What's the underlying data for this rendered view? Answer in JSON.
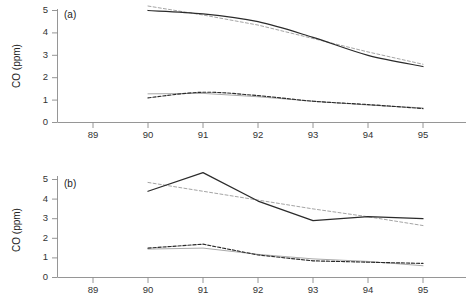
{
  "figure": {
    "background": "#ffffff",
    "width": 474,
    "height": 305,
    "panel_count": 2
  },
  "colors": {
    "observed": "#2b2b2b",
    "trend": "#9a9a9a",
    "axis": "#8a8a8a",
    "text": "#222222"
  },
  "axes": {
    "y_title": "CO (ppm)",
    "y_ticks": [
      "0",
      "1",
      "2",
      "3",
      "4",
      "5"
    ],
    "x_ticks": [
      "89",
      "90",
      "91",
      "92",
      "93",
      "94",
      "95"
    ]
  },
  "panels": {
    "a": {
      "label": "(a)"
    },
    "b": {
      "label": "(b)"
    }
  },
  "chart_data": [
    {
      "type": "line",
      "panel": "(a)",
      "title": "",
      "xlabel": "",
      "ylabel": "CO (ppm)",
      "xlim": [
        88.5,
        95.6
      ],
      "ylim": [
        0,
        5.3
      ],
      "xticks": [
        89,
        90,
        91,
        92,
        93,
        94,
        95
      ],
      "yticks": [
        0,
        1,
        2,
        3,
        4,
        5
      ],
      "grid": false,
      "legend": "none",
      "x": [
        90,
        91,
        92,
        93,
        94,
        95
      ],
      "series": [
        {
          "name": "upper-observed",
          "style": "solid",
          "color": "#2b2b2b",
          "values": [
            5.0,
            4.85,
            4.5,
            3.8,
            3.0,
            2.5
          ]
        },
        {
          "name": "upper-trend",
          "style": "dashed",
          "color": "#9a9a9a",
          "values": [
            5.2,
            4.8,
            4.35,
            3.75,
            3.15,
            2.6
          ]
        },
        {
          "name": "lower-observed",
          "style": "dashed",
          "color": "#2b2b2b",
          "values": [
            1.1,
            1.35,
            1.2,
            0.95,
            0.8,
            0.62
          ]
        },
        {
          "name": "lower-trend",
          "style": "solid",
          "color": "#9a9a9a",
          "values": [
            1.28,
            1.3,
            1.15,
            0.95,
            0.78,
            0.65
          ]
        }
      ]
    },
    {
      "type": "line",
      "panel": "(b)",
      "title": "",
      "xlabel": "",
      "ylabel": "CO (ppm)",
      "xlim": [
        88.5,
        95.6
      ],
      "ylim": [
        0,
        5.5
      ],
      "xticks": [
        89,
        90,
        91,
        92,
        93,
        94,
        95
      ],
      "yticks": [
        0,
        1,
        2,
        3,
        4,
        5
      ],
      "grid": false,
      "legend": "none",
      "x": [
        90,
        91,
        92,
        93,
        94,
        95
      ],
      "series": [
        {
          "name": "upper-observed",
          "style": "solid",
          "color": "#2b2b2b",
          "values": [
            4.4,
            5.35,
            3.9,
            2.9,
            3.1,
            3.0
          ]
        },
        {
          "name": "upper-trend",
          "style": "dashed",
          "color": "#9a9a9a",
          "values": [
            4.85,
            4.4,
            3.95,
            3.5,
            3.1,
            2.65
          ]
        },
        {
          "name": "lower-observed",
          "style": "dashed",
          "color": "#2b2b2b",
          "values": [
            1.5,
            1.7,
            1.15,
            0.85,
            0.78,
            0.72
          ]
        },
        {
          "name": "lower-trend",
          "style": "solid",
          "color": "#9a9a9a",
          "values": [
            1.45,
            1.5,
            1.18,
            0.95,
            0.82,
            0.6
          ]
        }
      ]
    }
  ]
}
